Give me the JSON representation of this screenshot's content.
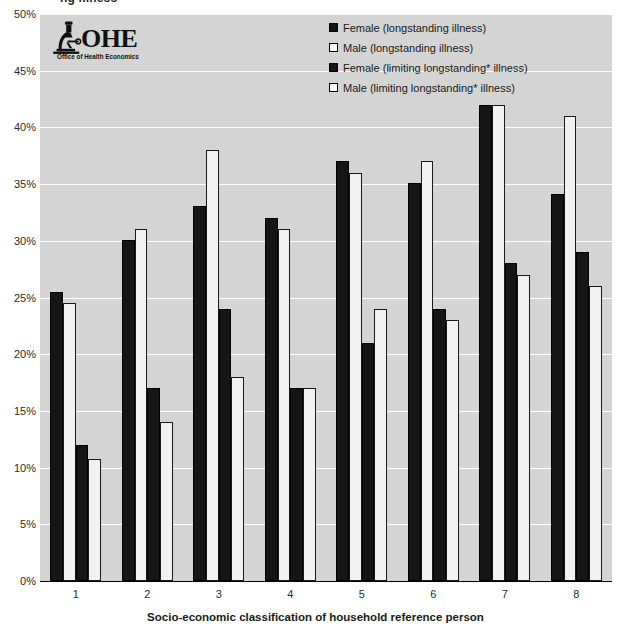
{
  "chart_data": {
    "type": "bar",
    "title": "",
    "xlabel": "Socio-economic classification of household reference person",
    "ylabel": "",
    "ylim": [
      0,
      50
    ],
    "grid": true,
    "legend_position": "top-right",
    "categories": [
      "1",
      "2",
      "3",
      "4",
      "5",
      "6",
      "7",
      "8"
    ],
    "ytick_labels": [
      "0%",
      "5%",
      "10%",
      "15%",
      "20%",
      "25%",
      "30%",
      "35%",
      "40%",
      "45%",
      "50%"
    ],
    "ytick_values": [
      0,
      5,
      10,
      15,
      20,
      25,
      30,
      35,
      40,
      45,
      50
    ],
    "series": [
      {
        "name": "Female (longstanding illness)",
        "style": "dark",
        "values": [
          25.5,
          30.1,
          33.1,
          32.0,
          37.0,
          35.1,
          42.0,
          34.1
        ]
      },
      {
        "name": "Male (longstanding illness)",
        "style": "light",
        "values": [
          24.5,
          31.0,
          38.0,
          31.0,
          36.0,
          37.0,
          42.0,
          41.0
        ]
      },
      {
        "name": "Female (limiting longstanding* illness)",
        "style": "dark",
        "values": [
          12.0,
          17.0,
          24.0,
          17.0,
          21.0,
          24.0,
          28.0,
          29.0
        ]
      },
      {
        "name": "Male (limiting longstanding* illness)",
        "style": "light",
        "values": [
          10.8,
          14.0,
          18.0,
          17.0,
          24.0,
          23.0,
          27.0,
          26.0
        ]
      }
    ]
  },
  "top_title_fragment": "ng illness",
  "logo": {
    "name": "ohe-logo",
    "acronym": "OHE",
    "tagline": "Office of Health Economics",
    "icon": "microscope-icon"
  },
  "colors": {
    "plot_background": "#d4d4d4",
    "gridline": "#ffffff",
    "dark_bar": "#151515",
    "light_bar": "#f2f2f2",
    "bar_outline": "#000000",
    "text": "#1a1a1a"
  }
}
